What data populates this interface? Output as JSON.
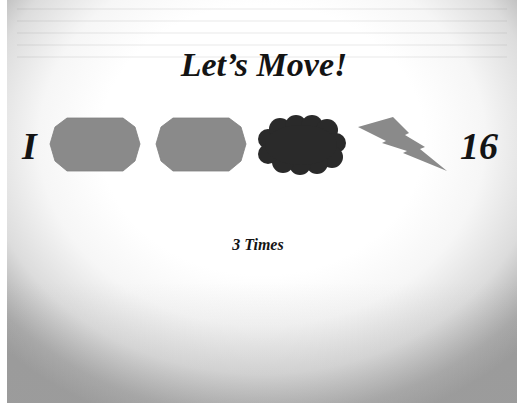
{
  "slide": {
    "title": "Let’s Move!",
    "start_label": "I",
    "end_label": "16",
    "caption": "3 Times",
    "shapes": [
      {
        "type": "octagon",
        "icon": "octagon-shape-icon",
        "color": "#8a8a8a"
      },
      {
        "type": "octagon",
        "icon": "octagon-shape-icon",
        "color": "#8a8a8a"
      },
      {
        "type": "cloud",
        "icon": "cloud-shape-icon",
        "color": "#2a2a2a"
      },
      {
        "type": "lightning",
        "icon": "lightning-bolt-icon",
        "color": "#8a8a8a"
      }
    ]
  },
  "colors": {
    "text": "#141414",
    "shape_gray": "#8a8a8a",
    "shape_dark": "#2a2a2a",
    "background_top": "#ffffff",
    "background_bottom": "#9d9d9d"
  }
}
